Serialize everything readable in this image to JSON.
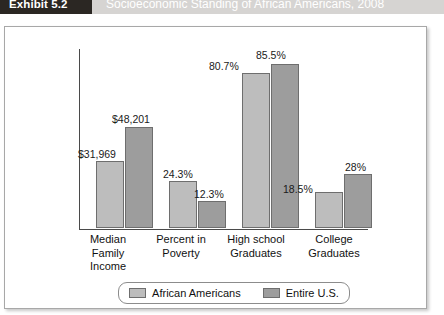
{
  "header": {
    "exhibit_number": "Exhibit 5.2",
    "title": "Socioeconomic Standing of African Americans, 2008"
  },
  "chart_data": {
    "type": "bar",
    "title": "Socioeconomic Standing of African Americans, 2008",
    "xlabel": "",
    "ylabel": "",
    "grid": false,
    "legend_position": "bottom",
    "ylim": [
      0,
      100
    ],
    "categories": [
      "Median\nFamily\nIncome",
      "Percent in\nPoverty",
      "High school\nGraduates",
      "College\nGraduates"
    ],
    "series": [
      {
        "name": "African Americans",
        "color": "#bdbdbd",
        "values": [
          31969,
          24.3,
          80.7,
          18.5
        ],
        "labels": [
          "$31,969",
          "24.3%",
          "80.7%",
          "18.5%"
        ],
        "plot_heights_pct": [
          37,
          26,
          86,
          20
        ]
      },
      {
        "name": "Entire U.S.",
        "color": "#9d9d9d",
        "values": [
          48201,
          12.3,
          85.5,
          28
        ],
        "labels": [
          "$48,201",
          "12.3%",
          "85.5%",
          "28%"
        ],
        "plot_heights_pct": [
          56,
          15,
          91,
          30
        ]
      }
    ]
  },
  "legend": {
    "items": [
      {
        "label": "African Americans",
        "color": "#bdbdbd"
      },
      {
        "label": "Entire U.S.",
        "color": "#9d9d9d"
      }
    ]
  }
}
